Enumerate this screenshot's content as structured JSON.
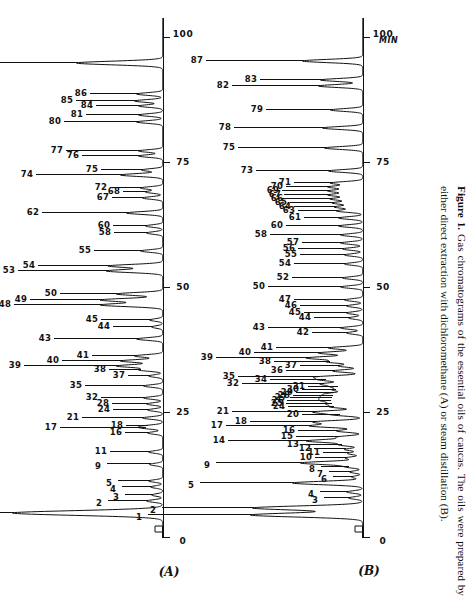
{
  "figure": {
    "label": "Figure 1.",
    "caption": " Gas chromatograms of the essential oils of caucas. The oils were prepared by either direct extraction with dichloromethane (A) or steam distillation (B).",
    "axis_unit": "MIN"
  },
  "chart_data": {
    "type": "line",
    "title": "Gas chromatograms of the essential oils of caucas",
    "xlabel": "MIN",
    "ylabel": "",
    "xlim": [
      0,
      104
    ],
    "ticks": [
      0,
      25,
      50,
      75,
      100
    ],
    "grid": false,
    "legend": "none",
    "orientation": "rotated-90ccw",
    "panels": [
      {
        "name": "A",
        "label": "(A)",
        "description": "direct extraction with dichloromethane",
        "peaks": [
          {
            "id": "1",
            "x": 5.0,
            "h": 150,
            "lead": 104
          },
          {
            "id": "2",
            "x": 7.4,
            "h": 16,
            "lead": 40
          },
          {
            "id": "3",
            "x": 8.6,
            "h": 11,
            "lead": 28
          },
          {
            "id": "4",
            "x": 10.2,
            "h": 12,
            "lead": 30
          },
          {
            "id": "5",
            "x": 11.4,
            "h": 14,
            "lead": 32
          },
          {
            "id": "9",
            "x": 14.7,
            "h": 13,
            "lead": 44
          },
          {
            "id": "11",
            "x": 17.2,
            "h": 14,
            "lead": 40
          },
          {
            "id": "16",
            "x": 21.0,
            "h": 15,
            "lead": 24
          },
          {
            "id": "18",
            "x": 22.4,
            "h": 16,
            "lead": 22
          },
          {
            "id": "17",
            "x": 22.0,
            "h": 18,
            "lead": 86
          },
          {
            "id": "21",
            "x": 24.0,
            "h": 20,
            "lead": 62
          },
          {
            "id": "24",
            "x": 25.6,
            "h": 15,
            "lead": 36
          },
          {
            "id": "28",
            "x": 26.8,
            "h": 16,
            "lead": 36
          },
          {
            "id": "32",
            "x": 28.0,
            "h": 19,
            "lead": 44
          },
          {
            "id": "35",
            "x": 30.4,
            "h": 19,
            "lead": 60
          },
          {
            "id": "37",
            "x": 32.4,
            "h": 14,
            "lead": 22
          },
          {
            "id": "38",
            "x": 33.6,
            "h": 23,
            "lead": 32
          },
          {
            "id": "39",
            "x": 34.4,
            "h": 46,
            "lead": 94
          },
          {
            "id": "40",
            "x": 35.4,
            "h": 42,
            "lead": 60
          },
          {
            "id": "41",
            "x": 36.4,
            "h": 28,
            "lead": 44
          },
          {
            "id": "43",
            "x": 39.8,
            "h": 26,
            "lead": 84
          },
          {
            "id": "44",
            "x": 42.2,
            "h": 11,
            "lead": 40
          },
          {
            "id": "45",
            "x": 43.6,
            "h": 13,
            "lead": 50
          },
          {
            "id": "48",
            "x": 46.6,
            "h": 62,
            "lead": 88
          },
          {
            "id": "49",
            "x": 47.6,
            "h": 62,
            "lead": 72
          },
          {
            "id": "50",
            "x": 48.8,
            "h": 46,
            "lead": 58
          },
          {
            "id": "53",
            "x": 53.4,
            "h": 56,
            "lead": 90
          },
          {
            "id": "54",
            "x": 54.4,
            "h": 54,
            "lead": 72
          },
          {
            "id": "55",
            "x": 57.4,
            "h": 22,
            "lead": 48
          },
          {
            "id": "58",
            "x": 61.0,
            "h": 16,
            "lead": 34
          },
          {
            "id": "60",
            "x": 62.4,
            "h": 17,
            "lead": 34
          },
          {
            "id": "62",
            "x": 65.0,
            "h": 36,
            "lead": 86
          },
          {
            "id": "67",
            "x": 68.0,
            "h": 20,
            "lead": 32
          },
          {
            "id": "68",
            "x": 69.2,
            "h": 17,
            "lead": 24
          },
          {
            "id": "72",
            "x": 70.0,
            "h": 22,
            "lead": 32
          },
          {
            "id": "74",
            "x": 72.6,
            "h": 42,
            "lead": 86
          },
          {
            "id": "75",
            "x": 73.6,
            "h": 21,
            "lead": 42
          },
          {
            "id": "76",
            "x": 76.4,
            "h": 24,
            "lead": 58
          },
          {
            "id": "77",
            "x": 77.4,
            "h": 24,
            "lead": 74
          },
          {
            "id": "80",
            "x": 83.2,
            "h": 26,
            "lead": 74
          },
          {
            "id": "81",
            "x": 84.6,
            "h": 24,
            "lead": 54
          },
          {
            "id": "84",
            "x": 86.4,
            "h": 24,
            "lead": 44
          },
          {
            "id": "85",
            "x": 87.4,
            "h": 28,
            "lead": 60
          },
          {
            "id": "86",
            "x": 88.8,
            "h": 26,
            "lead": 48
          },
          {
            "id": "87",
            "x": 95.0,
            "h": 86,
            "lead": 102
          }
        ]
      },
      {
        "name": "B",
        "label": "(B)",
        "description": "steam distillation",
        "peaks": [
          {
            "id": "1",
            "x": 4.6,
            "h": 112,
            "lead": 104
          },
          {
            "id": "2",
            "x": 6.0,
            "h": 110,
            "lead": 92
          },
          {
            "id": "3",
            "x": 8.0,
            "h": 14,
            "lead": 26
          },
          {
            "id": "4",
            "x": 9.2,
            "h": 16,
            "lead": 28
          },
          {
            "id": "5",
            "x": 11.0,
            "h": 70,
            "lead": 94
          },
          {
            "id": "6",
            "x": 12.2,
            "h": 11,
            "lead": 20
          },
          {
            "id": "7",
            "x": 13.2,
            "h": 13,
            "lead": 22
          },
          {
            "id": "8",
            "x": 14.2,
            "h": 15,
            "lead": 28
          },
          {
            "id": "9",
            "x": 15.0,
            "h": 62,
            "lead": 86
          },
          {
            "id": "10",
            "x": 16.0,
            "h": 17,
            "lead": 32
          },
          {
            "id": "11",
            "x": 16.9,
            "h": 15,
            "lead": 26
          },
          {
            "id": "12",
            "x": 17.7,
            "h": 18,
            "lead": 32
          },
          {
            "id": "13",
            "x": 18.6,
            "h": 22,
            "lead": 40
          },
          {
            "id": "14",
            "x": 19.4,
            "h": 56,
            "lead": 80
          },
          {
            "id": "15",
            "x": 20.2,
            "h": 24,
            "lead": 44
          },
          {
            "id": "16",
            "x": 21.4,
            "h": 26,
            "lead": 40
          },
          {
            "id": "17",
            "x": 22.4,
            "h": 52,
            "lead": 86
          },
          {
            "id": "18",
            "x": 23.2,
            "h": 48,
            "lead": 66
          },
          {
            "id": "20",
            "x": 24.6,
            "h": 24,
            "lead": 38
          },
          {
            "id": "21",
            "x": 25.2,
            "h": 48,
            "lead": 84
          },
          {
            "id": "24",
            "x": 26.2,
            "h": 30,
            "lead": 46
          },
          {
            "id": "25",
            "x": 26.8,
            "h": 32,
            "lead": 46
          },
          {
            "id": "26",
            "x": 27.4,
            "h": 33,
            "lead": 44
          },
          {
            "id": "27",
            "x": 27.9,
            "h": 32,
            "lead": 42
          },
          {
            "id": "28",
            "x": 28.4,
            "h": 31,
            "lead": 40
          },
          {
            "id": "29",
            "x": 28.9,
            "h": 30,
            "lead": 38
          },
          {
            "id": "30",
            "x": 29.6,
            "h": 28,
            "lead": 34
          },
          {
            "id": "31",
            "x": 30.2,
            "h": 26,
            "lead": 30
          },
          {
            "id": "32",
            "x": 30.8,
            "h": 40,
            "lead": 82
          },
          {
            "id": "34",
            "x": 31.6,
            "h": 38,
            "lead": 56
          },
          {
            "id": "35",
            "x": 32.2,
            "h": 44,
            "lead": 82
          },
          {
            "id": "36",
            "x": 33.4,
            "h": 30,
            "lead": 48
          },
          {
            "id": "37",
            "x": 34.4,
            "h": 24,
            "lead": 40
          },
          {
            "id": "38",
            "x": 35.2,
            "h": 34,
            "lead": 56
          },
          {
            "id": "39",
            "x": 36.0,
            "h": 56,
            "lead": 92
          },
          {
            "id": "40",
            "x": 37.0,
            "h": 44,
            "lead": 66
          },
          {
            "id": "41",
            "x": 38.0,
            "h": 34,
            "lead": 54
          },
          {
            "id": "42",
            "x": 41.0,
            "h": 16,
            "lead": 36
          },
          {
            "id": "43",
            "x": 42.0,
            "h": 22,
            "lead": 74
          },
          {
            "id": "44",
            "x": 44.0,
            "h": 14,
            "lead": 36
          },
          {
            "id": "45",
            "x": 45.0,
            "h": 16,
            "lead": 44
          },
          {
            "id": "46",
            "x": 46.4,
            "h": 16,
            "lead": 48
          },
          {
            "id": "47",
            "x": 47.6,
            "h": 18,
            "lead": 52
          },
          {
            "id": "50",
            "x": 50.2,
            "h": 22,
            "lead": 74
          },
          {
            "id": "52",
            "x": 52.0,
            "h": 20,
            "lead": 52
          },
          {
            "id": "54",
            "x": 54.8,
            "h": 18,
            "lead": 52
          },
          {
            "id": "55",
            "x": 56.6,
            "h": 18,
            "lead": 46
          },
          {
            "id": "56",
            "x": 57.8,
            "h": 20,
            "lead": 46
          },
          {
            "id": "57",
            "x": 59.0,
            "h": 22,
            "lead": 40
          },
          {
            "id": "58",
            "x": 60.6,
            "h": 22,
            "lead": 72
          },
          {
            "id": "60",
            "x": 62.4,
            "h": 24,
            "lead": 54
          },
          {
            "id": "61",
            "x": 64.0,
            "h": 24,
            "lead": 36
          },
          {
            "id": "63",
            "x": 65.4,
            "h": 26,
            "lead": 40
          },
          {
            "id": "64",
            "x": 66.2,
            "h": 28,
            "lead": 42
          },
          {
            "id": "65",
            "x": 67.0,
            "h": 30,
            "lead": 44
          },
          {
            "id": "66",
            "x": 67.8,
            "h": 32,
            "lead": 46
          },
          {
            "id": "67",
            "x": 68.6,
            "h": 34,
            "lead": 46
          },
          {
            "id": "69",
            "x": 69.4,
            "h": 34,
            "lead": 48
          },
          {
            "id": "70",
            "x": 70.2,
            "h": 34,
            "lead": 44
          },
          {
            "id": "71",
            "x": 71.0,
            "h": 32,
            "lead": 38
          },
          {
            "id": "73",
            "x": 73.4,
            "h": 34,
            "lead": 74
          },
          {
            "id": "75",
            "x": 78.0,
            "h": 38,
            "lead": 88
          },
          {
            "id": "78",
            "x": 82.0,
            "h": 40,
            "lead": 90
          },
          {
            "id": "79",
            "x": 85.6,
            "h": 32,
            "lead": 66
          },
          {
            "id": "82",
            "x": 90.4,
            "h": 44,
            "lead": 88
          },
          {
            "id": "83",
            "x": 91.6,
            "h": 42,
            "lead": 62
          },
          {
            "id": "87",
            "x": 95.4,
            "h": 60,
            "lead": 98
          }
        ]
      }
    ]
  }
}
